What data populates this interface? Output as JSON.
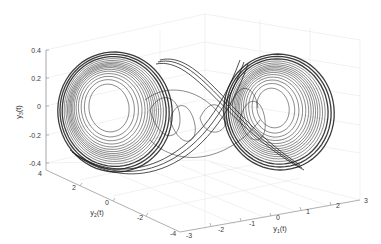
{
  "chart_data": {
    "type": "line",
    "subtype": "3d-parametric-trajectory",
    "title": "",
    "xlabel": "y1(t)",
    "ylabel": "y2(t)",
    "zlabel": "y3(t)",
    "xlim": [
      -3,
      3
    ],
    "ylim": [
      -4,
      4
    ],
    "zlim": [
      -0.4,
      0.4
    ],
    "x_ticks": [
      "-3",
      "-2",
      "-1",
      "0",
      "1",
      "2",
      "3"
    ],
    "y_ticks": [
      "4",
      "2",
      "0",
      "-2",
      "-4"
    ],
    "z_ticks": [
      "0.4",
      "0.2",
      "0",
      "-0.2",
      "-0.4"
    ],
    "grid": true,
    "legend": null,
    "line_color": "#1a1a1a",
    "series": [
      {
        "name": "trajectory",
        "scrolls": [
          {
            "name": "left-scroll",
            "center_y1": -1.6,
            "center_y2": 1.5,
            "center_y3": 0.0,
            "outer_radius_y1": 1.4,
            "inner_radius_y1": 0.55
          },
          {
            "name": "right-scroll",
            "center_y1": 1.6,
            "center_y2": -1.5,
            "center_y3": 0.0,
            "outer_radius_y1": 1.4,
            "inner_radius_y1": 0.45
          }
        ]
      }
    ]
  },
  "axes": {
    "z": {
      "label_main": "y",
      "label_sub": "3",
      "label_tail": "(t)"
    },
    "y": {
      "label_main": "y",
      "label_sub": "2",
      "label_tail": "(t)"
    },
    "x": {
      "label_main": "y",
      "label_sub": "1",
      "label_tail": "(t)"
    }
  },
  "colors": {
    "background": "#ffffff",
    "grid": "#e6e6e6",
    "axis": "#9a9a9a",
    "tick_text": "#3a3a3a",
    "trajectory": "#1a1a1a"
  }
}
